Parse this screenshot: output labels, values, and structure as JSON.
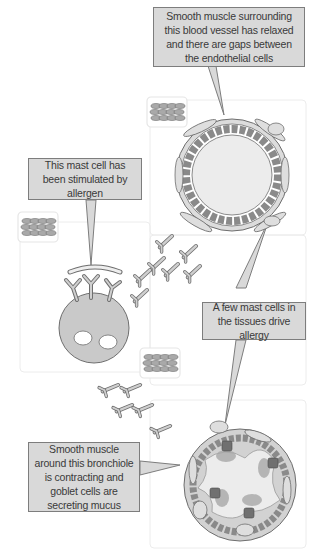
{
  "diagram": {
    "type": "biological-illustration",
    "colors": {
      "callout_fill": "#d9d9d9",
      "callout_border": "#7d7d7d",
      "cell_fill": "#c9c9c9",
      "panel_border": "#ececec",
      "text": "#3a3a3a"
    },
    "callouts": [
      {
        "id": "blood-vessel",
        "text": "Smooth muscle surrounding this blood vessel has relaxed and there are gaps between the endothelial cells"
      },
      {
        "id": "mast-cell",
        "text": "This mast cell has been stimulated by allergen"
      },
      {
        "id": "tissue-mast-cells",
        "text": "A few mast cells in the tissues drive allergy"
      },
      {
        "id": "bronchiole",
        "text": "Smooth muscle around this bronchiole is contracting and goblet cells are secreting mucus"
      }
    ],
    "components": [
      {
        "id": "blood-vessel",
        "label": "Blood vessel cross-section"
      },
      {
        "id": "mast-cell",
        "label": "Activated mast cell with IgE antibodies and allergen"
      },
      {
        "id": "mediators",
        "label": "Released mediators (Y-shaped)"
      },
      {
        "id": "bronchiole",
        "label": "Bronchiole cross-section with goblet cells and mucus"
      },
      {
        "id": "smooth-muscle-icons",
        "label": "Smooth muscle tissue icons",
        "count": 3
      }
    ]
  }
}
